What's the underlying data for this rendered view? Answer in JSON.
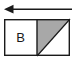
{
  "figure": {
    "background_color": "#ffffff",
    "width": 77,
    "height": 66
  },
  "arrow": {
    "name": "leftward arrow",
    "direction": "left",
    "color": "#1a1a1a",
    "line_start_x": 72,
    "line_end_x": 11,
    "line_y": 9,
    "head_tip_x": 4,
    "head_half_height": 4,
    "stroke_width": 1.6
  },
  "box": {
    "border_color": "#1a1a1a",
    "border_width": 1.4,
    "fill_color": "#ffffff",
    "x": 4,
    "y": 19,
    "width": 66,
    "height": 37,
    "divider_x": 37,
    "cells": [
      {
        "id": "left-cell",
        "label": "B",
        "fill": "#ffffff",
        "shaded": false
      },
      {
        "id": "right-cell",
        "label": "",
        "fill": "#ffffff",
        "shaded": true,
        "shade_color": "#a8a8a8",
        "shade_shape": "upper-left triangle",
        "diagonal": "bottom-left to top-right"
      }
    ]
  }
}
